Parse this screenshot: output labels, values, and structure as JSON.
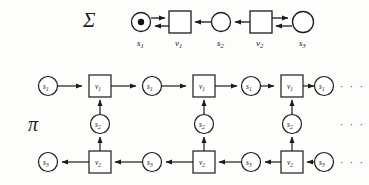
{
  "figure": {
    "title_sigma": "Σ",
    "title_pi": "π",
    "ellipsis": "· · ·",
    "colors": {
      "ink": "#1b1b1b",
      "paper": "#fdfdfb",
      "token": "#111111"
    }
  },
  "net": {
    "name": "sigma-petri-net",
    "nodes": [
      {
        "id": "s1",
        "label": "s",
        "sub": "1",
        "type": "place",
        "x": 141,
        "y": 22,
        "r": 10,
        "token": true
      },
      {
        "id": "v1",
        "label": "v",
        "sub": "1",
        "type": "transition",
        "x": 180,
        "y": 22,
        "w": 22,
        "h": 22,
        "token": false
      },
      {
        "id": "s2",
        "label": "s",
        "sub": "2",
        "type": "place",
        "x": 221,
        "y": 22,
        "r": 10,
        "token": false
      },
      {
        "id": "v2",
        "label": "v",
        "sub": "2",
        "type": "transition",
        "x": 261,
        "y": 22,
        "w": 22,
        "h": 22,
        "token": false
      },
      {
        "id": "s3",
        "label": "s",
        "sub": "3",
        "type": "place",
        "x": 302,
        "y": 22,
        "r": 11,
        "token": false
      }
    ],
    "labels": [
      {
        "for": "s1",
        "label": "s",
        "sub": "1",
        "x": 141,
        "y": 44
      },
      {
        "for": "v1",
        "label": "v",
        "sub": "1",
        "x": 180,
        "y": 44
      },
      {
        "for": "s2",
        "label": "s",
        "sub": "2",
        "x": 221,
        "y": 44
      },
      {
        "for": "v2",
        "label": "v",
        "sub": "2",
        "x": 261,
        "y": 44
      },
      {
        "for": "s3",
        "label": "s",
        "sub": "3",
        "x": 302,
        "y": 44
      }
    ],
    "arcs": [
      {
        "from": "s1",
        "to": "v1",
        "dir": "right",
        "offset": -4
      },
      {
        "from": "v1",
        "to": "s1",
        "dir": "left",
        "offset": 4
      },
      {
        "from": "s2",
        "to": "v1",
        "dir": "left",
        "offset": 0
      },
      {
        "from": "v2",
        "to": "s2",
        "dir": "left",
        "offset": 0
      },
      {
        "from": "v2",
        "to": "s3",
        "dir": "right",
        "offset": -4
      },
      {
        "from": "s3",
        "to": "v2",
        "dir": "left",
        "offset": 4
      }
    ]
  },
  "unfolding": {
    "name": "pi-occurrence-net",
    "rows": {
      "top_y": 86,
      "mid_y": 124,
      "bot_y": 162
    },
    "top_row": [
      {
        "id": "u-s1-a",
        "label": "s",
        "sub": "1",
        "type": "place",
        "x": 48,
        "y": 86
      },
      {
        "id": "u-v1-a",
        "label": "v",
        "sub": "1",
        "type": "transition",
        "x": 100,
        "y": 86
      },
      {
        "id": "u-s1-b",
        "label": "s",
        "sub": "1",
        "type": "place",
        "x": 152,
        "y": 86
      },
      {
        "id": "u-v1-b",
        "label": "v",
        "sub": "1",
        "type": "transition",
        "x": 204,
        "y": 86
      },
      {
        "id": "u-s1-c",
        "label": "s",
        "sub": "1",
        "type": "place",
        "x": 256,
        "y": 86
      },
      {
        "id": "u-v1-c",
        "label": "v",
        "sub": "1",
        "type": "transition",
        "x": 285,
        "y": 86
      },
      {
        "id": "u-s1-d",
        "label": "s",
        "sub": "1",
        "type": "place",
        "x": 318,
        "y": 86
      }
    ],
    "mid_row": [
      {
        "id": "u-s2-a",
        "label": "s",
        "sub": "2",
        "type": "place",
        "x": 100,
        "y": 124
      },
      {
        "id": "u-s2-b",
        "label": "s",
        "sub": "2",
        "type": "place",
        "x": 204,
        "y": 124
      },
      {
        "id": "u-s2-c",
        "label": "s",
        "sub": "2",
        "type": "place",
        "x": 285,
        "y": 124
      }
    ],
    "bot_row": [
      {
        "id": "u-s3-a",
        "label": "s",
        "sub": "3",
        "type": "place",
        "x": 48,
        "y": 162
      },
      {
        "id": "u-v2-a",
        "label": "v",
        "sub": "2",
        "type": "transition",
        "x": 100,
        "y": 162
      },
      {
        "id": "u-s3-b",
        "label": "s",
        "sub": "3",
        "type": "place",
        "x": 152,
        "y": 162
      },
      {
        "id": "u-v2-b",
        "label": "v",
        "sub": "2",
        "type": "transition",
        "x": 204,
        "y": 162
      },
      {
        "id": "u-s3-c",
        "label": "s",
        "sub": "3",
        "type": "place",
        "x": 256,
        "y": 162
      },
      {
        "id": "u-v2-c",
        "label": "v",
        "sub": "2",
        "type": "transition",
        "x": 285,
        "y": 162
      },
      {
        "id": "u-s3-d",
        "label": "s",
        "sub": "3",
        "type": "place",
        "x": 318,
        "y": 162
      }
    ],
    "flow": {
      "top_direction": "left-to-right",
      "bottom_direction": "right-to-left",
      "vertical_direction": "bottom-to-top"
    },
    "ellipses": [
      {
        "x": 348,
        "y": 90
      },
      {
        "x": 348,
        "y": 128
      },
      {
        "x": 348,
        "y": 166
      }
    ]
  }
}
